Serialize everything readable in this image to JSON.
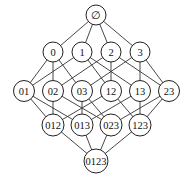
{
  "diagram": {
    "type": "hasse-diagram",
    "nodes": [
      {
        "id": "e",
        "label": "∅",
        "x": 96,
        "y": 15,
        "r": 10
      },
      {
        "id": "0",
        "label": "0",
        "x": 53,
        "y": 52,
        "r": 10
      },
      {
        "id": "1",
        "label": "1",
        "x": 82,
        "y": 52,
        "r": 10
      },
      {
        "id": "2",
        "label": "2",
        "x": 111,
        "y": 52,
        "r": 10
      },
      {
        "id": "3",
        "label": "3",
        "x": 140,
        "y": 52,
        "r": 10
      },
      {
        "id": "01",
        "label": "01",
        "x": 24,
        "y": 91,
        "r": 10.5
      },
      {
        "id": "02",
        "label": "02",
        "x": 53,
        "y": 91,
        "r": 10.5
      },
      {
        "id": "03",
        "label": "03",
        "x": 82,
        "y": 91,
        "r": 10.5
      },
      {
        "id": "12",
        "label": "12",
        "x": 111,
        "y": 91,
        "r": 10.5
      },
      {
        "id": "13",
        "label": "13",
        "x": 140,
        "y": 91,
        "r": 10.5
      },
      {
        "id": "23",
        "label": "23",
        "x": 169,
        "y": 91,
        "r": 10.5
      },
      {
        "id": "012",
        "label": "012",
        "x": 53,
        "y": 125,
        "r": 11
      },
      {
        "id": "013",
        "label": "013",
        "x": 82,
        "y": 125,
        "r": 11
      },
      {
        "id": "023",
        "label": "023",
        "x": 111,
        "y": 125,
        "r": 11
      },
      {
        "id": "123",
        "label": "123",
        "x": 140,
        "y": 125,
        "r": 11
      },
      {
        "id": "0123",
        "label": "0123",
        "x": 96,
        "y": 161,
        "r": 12
      }
    ],
    "edges": [
      [
        "e",
        "0"
      ],
      [
        "e",
        "1"
      ],
      [
        "e",
        "2"
      ],
      [
        "e",
        "3"
      ],
      [
        "0",
        "01"
      ],
      [
        "0",
        "02"
      ],
      [
        "0",
        "03"
      ],
      [
        "1",
        "01"
      ],
      [
        "1",
        "12"
      ],
      [
        "1",
        "13"
      ],
      [
        "2",
        "02"
      ],
      [
        "2",
        "12"
      ],
      [
        "2",
        "23"
      ],
      [
        "3",
        "03"
      ],
      [
        "3",
        "13"
      ],
      [
        "3",
        "23"
      ],
      [
        "01",
        "012"
      ],
      [
        "01",
        "013"
      ],
      [
        "02",
        "012"
      ],
      [
        "02",
        "023"
      ],
      [
        "03",
        "013"
      ],
      [
        "03",
        "023"
      ],
      [
        "12",
        "012"
      ],
      [
        "12",
        "123"
      ],
      [
        "13",
        "013"
      ],
      [
        "13",
        "123"
      ],
      [
        "23",
        "023"
      ],
      [
        "23",
        "123"
      ],
      [
        "012",
        "0123"
      ],
      [
        "013",
        "0123"
      ],
      [
        "023",
        "0123"
      ],
      [
        "123",
        "0123"
      ]
    ]
  }
}
